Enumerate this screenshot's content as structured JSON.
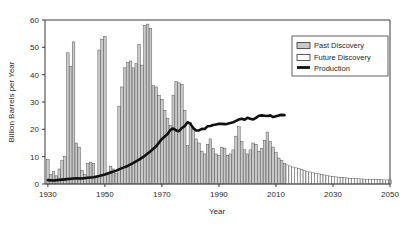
{
  "chart_data": {
    "type": "bar",
    "title": "",
    "xlabel": "Year",
    "ylabel": "Billion Barrels per Year",
    "xlim": [
      1929,
      2050
    ],
    "ylim": [
      0,
      60
    ],
    "yticks": [
      0,
      10,
      20,
      30,
      40,
      50,
      60
    ],
    "xticks": [
      1930,
      1950,
      1970,
      1990,
      2010,
      2030,
      2050
    ],
    "grid": false,
    "legend_position": "upper-right",
    "legend": [
      {
        "label": "Past Discovery",
        "kind": "bar-shaded",
        "color": "#c9c9c9"
      },
      {
        "label": "Future Discovery",
        "kind": "bar-open",
        "color": "#ffffff"
      },
      {
        "label": "Production",
        "kind": "line",
        "color": "#111111"
      }
    ],
    "series": [
      {
        "name": "Past Discovery",
        "type": "bar",
        "style": "shaded",
        "x": [
          1930,
          1931,
          1932,
          1933,
          1934,
          1935,
          1936,
          1937,
          1938,
          1939,
          1940,
          1941,
          1942,
          1943,
          1944,
          1945,
          1946,
          1947,
          1948,
          1949,
          1950,
          1951,
          1952,
          1953,
          1954,
          1955,
          1956,
          1957,
          1958,
          1959,
          1960,
          1961,
          1962,
          1963,
          1964,
          1965,
          1966,
          1967,
          1968,
          1969,
          1970,
          1971,
          1972,
          1973,
          1974,
          1975,
          1976,
          1977,
          1978,
          1979,
          1980,
          1981,
          1982,
          1983,
          1984,
          1985,
          1986,
          1987,
          1988,
          1989,
          1990,
          1991,
          1992,
          1993,
          1994,
          1995,
          1996,
          1997,
          1998,
          1999,
          2000,
          2001,
          2002,
          2003,
          2004,
          2005,
          2006,
          2007,
          2008,
          2009,
          2010,
          2011,
          2012,
          2013
        ],
        "values": [
          9.0,
          3.5,
          4.5,
          3.0,
          5.5,
          8.5,
          10.0,
          48.0,
          43.0,
          52.0,
          15.0,
          13.5,
          5.0,
          3.5,
          7.5,
          8.0,
          7.5,
          2.5,
          49.0,
          53.0,
          54.0,
          4.0,
          6.5,
          5.5,
          4.0,
          28.5,
          35.5,
          42.5,
          44.5,
          45.0,
          42.5,
          44.0,
          51.0,
          43.5,
          58.0,
          58.5,
          57.0,
          36.0,
          35.5,
          32.5,
          31.0,
          27.0,
          24.0,
          21.5,
          32.5,
          37.5,
          37.0,
          36.5,
          27.0,
          14.0,
          22.5,
          20.0,
          16.5,
          15.0,
          12.0,
          11.0,
          14.5,
          16.5,
          13.0,
          11.0,
          10.5,
          13.5,
          13.0,
          10.5,
          11.0,
          12.5,
          17.5,
          21.0,
          15.5,
          12.5,
          11.0,
          12.5,
          15.0,
          14.5,
          12.0,
          13.0,
          16.0,
          19.0,
          15.5,
          13.5,
          11.5,
          9.5,
          8.5,
          7.5
        ]
      },
      {
        "name": "Future Discovery",
        "type": "bar",
        "style": "open",
        "x": [
          2014,
          2015,
          2016,
          2017,
          2018,
          2019,
          2020,
          2021,
          2022,
          2023,
          2024,
          2025,
          2026,
          2027,
          2028,
          2029,
          2030,
          2031,
          2032,
          2033,
          2034,
          2035,
          2036,
          2037,
          2038,
          2039,
          2040,
          2041,
          2042,
          2043,
          2044,
          2045,
          2046,
          2047,
          2048,
          2049,
          2050
        ],
        "values": [
          7.0,
          6.6,
          6.2,
          5.9,
          5.6,
          5.3,
          5.0,
          4.7,
          4.4,
          4.1,
          3.9,
          3.7,
          3.5,
          3.3,
          3.1,
          2.9,
          2.7,
          2.6,
          2.5,
          2.4,
          2.3,
          2.2,
          2.1,
          2.0,
          1.95,
          1.9,
          1.85,
          1.8,
          1.75,
          1.7,
          1.65,
          1.6,
          1.58,
          1.55,
          1.52,
          1.5,
          1.5
        ]
      },
      {
        "name": "Production",
        "type": "line",
        "x": [
          1930,
          1932,
          1934,
          1936,
          1938,
          1940,
          1942,
          1944,
          1946,
          1948,
          1950,
          1952,
          1954,
          1956,
          1958,
          1960,
          1962,
          1964,
          1966,
          1968,
          1970,
          1972,
          1973,
          1974,
          1975,
          1976,
          1977,
          1978,
          1979,
          1980,
          1981,
          1982,
          1983,
          1984,
          1985,
          1986,
          1987,
          1988,
          1989,
          1990,
          1991,
          1992,
          1993,
          1994,
          1995,
          1996,
          1997,
          1998,
          1999,
          2000,
          2001,
          2002,
          2003,
          2004,
          2005,
          2006,
          2007,
          2008,
          2009,
          2010,
          2011,
          2012,
          2013
        ],
        "values": [
          1.4,
          1.3,
          1.5,
          1.7,
          1.9,
          2.1,
          2.0,
          2.3,
          2.5,
          2.9,
          3.5,
          4.2,
          4.9,
          5.8,
          6.6,
          7.7,
          8.9,
          10.3,
          12.0,
          13.8,
          16.5,
          18.3,
          19.8,
          20.3,
          19.6,
          19.3,
          20.5,
          21.2,
          22.6,
          22.0,
          20.5,
          19.6,
          19.6,
          20.2,
          20.1,
          21.1,
          21.2,
          21.6,
          21.8,
          22.0,
          22.0,
          21.9,
          22.0,
          22.3,
          22.6,
          23.1,
          23.6,
          23.9,
          23.5,
          24.2,
          23.9,
          23.6,
          24.2,
          25.0,
          25.1,
          25.0,
          24.9,
          25.1,
          24.5,
          24.8,
          25.1,
          25.3,
          25.2
        ]
      }
    ]
  }
}
